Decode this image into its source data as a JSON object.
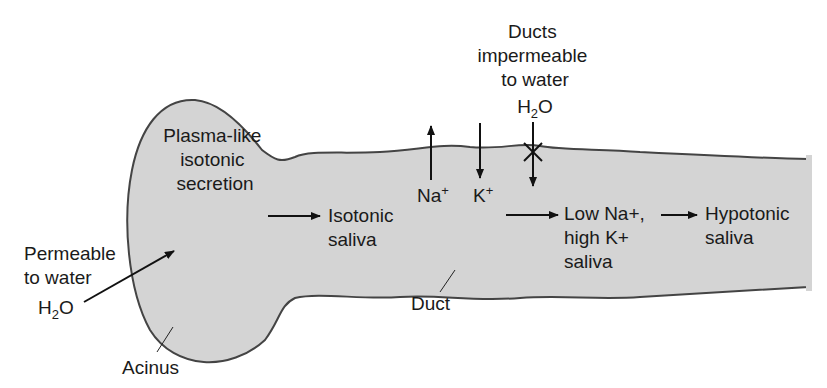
{
  "diagram": {
    "colors": {
      "tissue_fill": "#d4d4d4",
      "outline": "#444444",
      "text": "#1a1a1a",
      "arrow": "#111111"
    },
    "structures": {
      "acinus": "Acinus",
      "duct": "Duct"
    },
    "labels": {
      "acinus_secretion": [
        "Plasma-like",
        "isotonic",
        "secretion"
      ],
      "acinus_water": [
        "Permeable",
        "to water"
      ],
      "acinus_h2o": {
        "main": "H",
        "sub": "2",
        "tail": "O"
      },
      "isotonic_saliva": [
        "Isotonic",
        "saliva"
      ],
      "na": {
        "main": "Na",
        "sup": "+"
      },
      "k": {
        "main": "K",
        "sup": "+"
      },
      "duct_water": [
        "Ducts",
        "impermeable",
        "to water"
      ],
      "duct_h2o": {
        "main": "H",
        "sub": "2",
        "tail": "O"
      },
      "low_na": [
        "Low Na+,",
        "high K+",
        "saliva"
      ],
      "hypotonic": [
        "Hypotonic",
        "saliva"
      ]
    },
    "arrows": [
      {
        "id": "water-into-acinus",
        "direction": "into acinus"
      },
      {
        "id": "acinus-to-isotonic",
        "direction": "right"
      },
      {
        "id": "na-out",
        "direction": "up"
      },
      {
        "id": "k-in",
        "direction": "down"
      },
      {
        "id": "water-blocked",
        "direction": "down",
        "blocked": true
      },
      {
        "id": "isotonic-to-low-na",
        "direction": "right"
      },
      {
        "id": "low-na-to-hypotonic",
        "direction": "right"
      }
    ]
  }
}
